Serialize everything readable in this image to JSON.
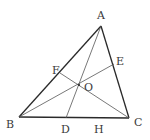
{
  "diagram": {
    "type": "geometry-triangle-cevians",
    "colors": {
      "thick_line": "#2a2a2a",
      "thin_line": "#555555",
      "label": "#3a3a3a"
    },
    "points": {
      "A": {
        "label": "A",
        "x": 101,
        "y": 26
      },
      "B": {
        "label": "B",
        "x": 19,
        "y": 117
      },
      "C": {
        "label": "C",
        "x": 129,
        "y": 118
      },
      "D": {
        "label": "D",
        "x": 66,
        "y": 118
      },
      "E": {
        "label": "E",
        "x": 114,
        "y": 64
      },
      "F": {
        "label": "F",
        "x": 60,
        "y": 73
      },
      "O": {
        "label": "O",
        "x": 79,
        "y": 85
      },
      "H": {
        "label": "H"
      }
    },
    "segments": [
      {
        "from": "A",
        "to": "B",
        "style": "thick"
      },
      {
        "from": "A",
        "to": "C",
        "style": "thick"
      },
      {
        "from": "B",
        "to": "C",
        "style": "thick"
      },
      {
        "from": "A",
        "to": "D",
        "style": "thin"
      },
      {
        "from": "B",
        "to": "E",
        "style": "thin"
      },
      {
        "from": "C",
        "to": "F",
        "style": "thin"
      }
    ]
  }
}
